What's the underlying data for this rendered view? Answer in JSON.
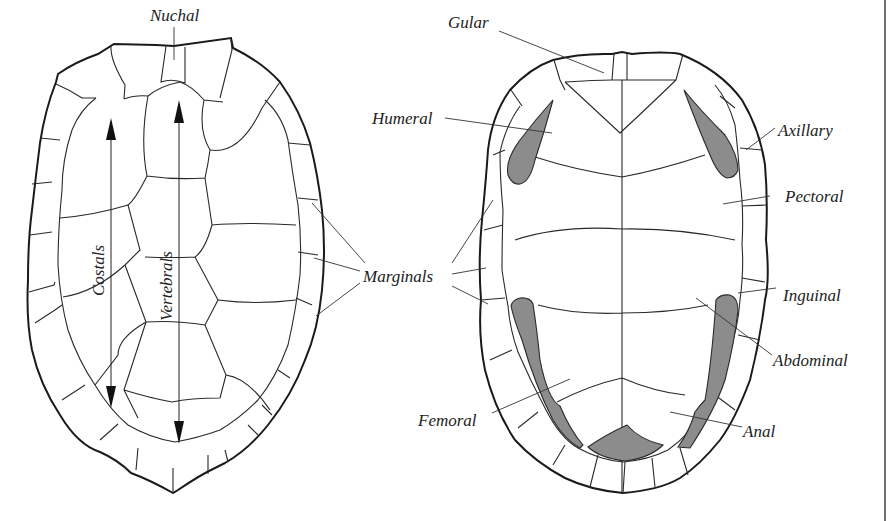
{
  "figure": {
    "colors": {
      "line": "#1a1a1a",
      "shaded": "#8c8c8c",
      "background": "#ffffff"
    }
  },
  "carapace": {
    "labels": {
      "nuchal": "Nuchal",
      "costals": "Costals",
      "vertebrals": "Vertebrals",
      "marginals": "Marginals"
    }
  },
  "plastron": {
    "labels": {
      "gular": "Gular",
      "humeral": "Humeral",
      "axillary": "Axillary",
      "pectoral": "Pectoral",
      "inguinal": "Inguinal",
      "abdominal": "Abdominal",
      "femoral": "Femoral",
      "anal": "Anal"
    }
  }
}
